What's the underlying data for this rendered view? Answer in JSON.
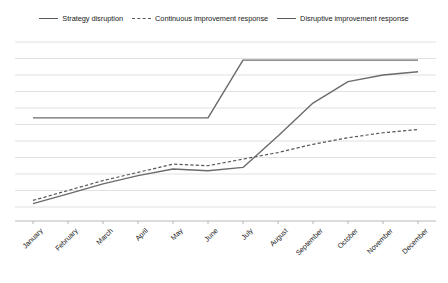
{
  "chart_data": {
    "type": "line",
    "title": "",
    "subtitle": "",
    "xlabel": "",
    "ylabel": "",
    "grid": true,
    "legend_position": "top-center",
    "ylim": [
      0,
      10
    ],
    "yticks": [
      0,
      1,
      2,
      3,
      4,
      5,
      6,
      7,
      8,
      9,
      10
    ],
    "y_tick_labels_visible": false,
    "categories": [
      "January",
      "February",
      "March",
      "April",
      "May",
      "June",
      "July",
      "August",
      "September",
      "October",
      "November",
      "December"
    ],
    "series": [
      {
        "name": "Strategy disruption",
        "style": "solid",
        "color": "#6b6b6b",
        "values": [
          5.4,
          5.4,
          5.4,
          5.4,
          5.4,
          5.4,
          8.9,
          8.9,
          8.9,
          8.9,
          8.9,
          8.9
        ]
      },
      {
        "name": "Continuous improvement response",
        "style": "dashed",
        "color": "#555555",
        "values": [
          0.4,
          1.0,
          1.6,
          2.1,
          2.6,
          2.5,
          2.9,
          3.3,
          3.8,
          4.2,
          4.5,
          4.7
        ]
      },
      {
        "name": "Disruptive improvement response",
        "style": "solid",
        "color": "#6b6b6b",
        "values": [
          0.2,
          0.8,
          1.4,
          1.9,
          2.3,
          2.2,
          2.4,
          4.3,
          6.3,
          7.6,
          8.0,
          8.2
        ]
      }
    ]
  },
  "legend": {
    "entries": [
      {
        "label": "Strategy disruption",
        "style": "solid"
      },
      {
        "label": "Continuous improvement response",
        "style": "dashed"
      },
      {
        "label": "Disruptive improvement response",
        "style": "solid"
      }
    ]
  },
  "colors": {
    "gridline": "#d9d9d9",
    "axis": "#b0b0b0",
    "series_solid": "#6b6b6b",
    "series_dashed": "#555555",
    "text": "#1a1a1a",
    "background": "#ffffff"
  }
}
